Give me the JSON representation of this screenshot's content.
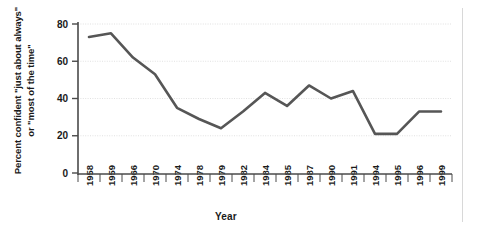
{
  "chart_data": {
    "type": "line",
    "title": "",
    "subtitle": "",
    "xlabel": "Year",
    "ylabel": "Percent confident \"just about always\"\nor \"most of the time\"",
    "categories": [
      "1958",
      "1959",
      "1966",
      "1970",
      "1974",
      "1978",
      "1979",
      "1982",
      "1984",
      "1985",
      "1987",
      "1990",
      "1991",
      "1994",
      "1995",
      "1996",
      "1999"
    ],
    "values": [
      73,
      75,
      62,
      53,
      35,
      29,
      24,
      33,
      43,
      36,
      47,
      40,
      44,
      21,
      21,
      33,
      33
    ],
    "series": [
      {
        "name": "Percent confident",
        "values": [
          73,
          75,
          62,
          53,
          35,
          29,
          24,
          33,
          43,
          36,
          47,
          40,
          44,
          21,
          21,
          33,
          33
        ],
        "color": "#565656"
      }
    ],
    "ylim": [
      0,
      80
    ],
    "yticks": [
      0,
      20,
      40,
      60,
      80
    ],
    "ytick_labels": [
      "0",
      "20",
      "40",
      "60",
      "80"
    ],
    "grid": "horizontal",
    "legend": "none",
    "line_color": "#565656",
    "grid_color": "#d9d9d9",
    "axis_color": "#4a4a4a",
    "background": "#ffffff"
  },
  "axes": {
    "x_axis_name": "year-axis",
    "y_axis_name": "percent-axis"
  }
}
